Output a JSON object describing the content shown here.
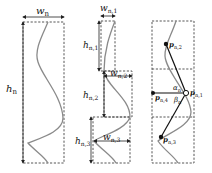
{
  "diagram": {
    "panels": [
      {
        "id": "whole",
        "width_label": "w",
        "width_sub": "n",
        "height_label": "h",
        "height_sub": "n"
      },
      {
        "id": "segments",
        "segments": [
          {
            "w_label": "w",
            "w_sub": "n,1",
            "h_label": "h",
            "h_sub": "n,1"
          },
          {
            "w_label": "w",
            "w_sub": "n,2",
            "h_label": "h",
            "h_sub": "n,2"
          },
          {
            "w_label": "w",
            "w_sub": "n,3",
            "h_label": "h",
            "h_sub": "n,3"
          }
        ]
      },
      {
        "id": "points",
        "points": [
          {
            "label": "p",
            "sub": "n,1"
          },
          {
            "label": "p",
            "sub": "n,2"
          },
          {
            "label": "p",
            "sub": "n,3"
          },
          {
            "label": "p",
            "sub": "n,4"
          }
        ],
        "angles": [
          {
            "label": "α",
            "sub": "n"
          },
          {
            "label": "β",
            "sub": "n"
          }
        ]
      }
    ]
  }
}
